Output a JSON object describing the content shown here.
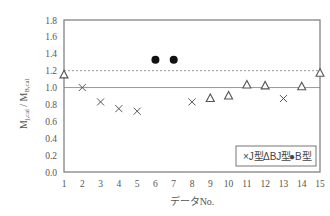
{
  "chart_data": {
    "type": "scatter",
    "title": "",
    "xlabel": "データNo.",
    "ylabel": "M_{j,cal} / M_{B,cal}",
    "ylabel_main_1": "M",
    "ylabel_sub_1": "j,cal",
    "ylabel_sep": " / ",
    "ylabel_main_2": "M",
    "ylabel_sub_2": "B,cal",
    "xlim": [
      1,
      15
    ],
    "ylim": [
      0.0,
      1.8
    ],
    "xticks": [
      "1",
      "2",
      "3",
      "4",
      "5",
      "6",
      "7",
      "8",
      "9",
      "10",
      "11",
      "12",
      "13",
      "14",
      "15"
    ],
    "yticks": [
      "0.0",
      "0.2",
      "0.4",
      "0.6",
      "0.8",
      "1.0",
      "1.2",
      "1.4",
      "1.6",
      "1.8"
    ],
    "grid": false,
    "reference_lines": [
      {
        "y": 1.0,
        "style": "solid"
      },
      {
        "y": 1.2,
        "style": "dashed"
      }
    ],
    "legend_position": "lower right inside",
    "series": [
      {
        "name": "J型",
        "marker": "x",
        "legend_label": "×J型",
        "points": [
          [
            2,
            1.0
          ],
          [
            3,
            0.83
          ],
          [
            4,
            0.75
          ],
          [
            5,
            0.72
          ],
          [
            8,
            0.83
          ],
          [
            13,
            0.87
          ]
        ]
      },
      {
        "name": "BJ型",
        "marker": "triangle-open",
        "legend_label": "ΔBJ型",
        "points": [
          [
            1,
            1.15
          ],
          [
            9,
            0.87
          ],
          [
            10,
            0.9
          ],
          [
            11,
            1.03
          ],
          [
            12,
            1.02
          ],
          [
            14,
            1.01
          ],
          [
            15,
            1.17
          ]
        ]
      },
      {
        "name": "B型",
        "marker": "circle-filled",
        "legend_label": "●B型",
        "points": [
          [
            6,
            1.33
          ],
          [
            7,
            1.33
          ]
        ]
      }
    ]
  },
  "legend": {
    "j_label": "×J型",
    "bj_label": "ΔBJ型",
    "b_label": "●B型"
  },
  "colors": {
    "axis": "#666666",
    "marker": "#555555",
    "filled_marker": "#111111",
    "text": "#555555"
  }
}
